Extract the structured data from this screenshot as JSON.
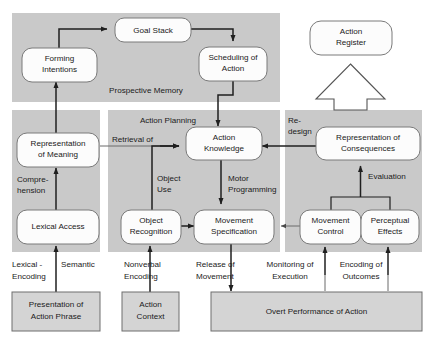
{
  "diagram": {
    "colors": {
      "band_fill": "#c9c9c9",
      "plain_box_fill": "#d4d4d4",
      "node_fill": "#fcfcfc",
      "node_stroke": "#7a7a7a",
      "connector": "#1f1f1f",
      "background": "#ffffff"
    },
    "bands": [
      {
        "id": "prospective-memory",
        "label": "Prospective Memory"
      },
      {
        "id": "lexical-semantic",
        "label": ""
      },
      {
        "id": "action-planning",
        "label": "Action Planning"
      },
      {
        "id": "evaluation-panel",
        "label": ""
      }
    ],
    "nodes": [
      {
        "id": "goal-stack",
        "label_line1": "Goal Stack",
        "label_line2": ""
      },
      {
        "id": "forming-intentions",
        "label_line1": "Forming",
        "label_line2": "Intentions"
      },
      {
        "id": "scheduling-of-action",
        "label_line1": "Scheduling of",
        "label_line2": "Action"
      },
      {
        "id": "action-register",
        "label_line1": "Action",
        "label_line2": "Register"
      },
      {
        "id": "representation-of-meaning",
        "label_line1": "Representation",
        "label_line2": "of Meaning"
      },
      {
        "id": "lexical-access",
        "label_line1": "Lexical Access",
        "label_line2": ""
      },
      {
        "id": "action-knowledge",
        "label_line1": "Action",
        "label_line2": "Knowledge"
      },
      {
        "id": "object-recognition",
        "label_line1": "Object",
        "label_line2": "Recognition"
      },
      {
        "id": "movement-specification",
        "label_line1": "Movement",
        "label_line2": "Specification"
      },
      {
        "id": "representation-of-consequences",
        "label_line1": "Representation of",
        "label_line2": "Consequences"
      },
      {
        "id": "movement-control",
        "label_line1": "Movement",
        "label_line2": "Control"
      },
      {
        "id": "perceptual-effects",
        "label_line1": "Perceptual",
        "label_line2": "Effects"
      },
      {
        "id": "presentation-of-action-phrase",
        "label_line1": "Presentation of",
        "label_line2": "Action Phrase"
      },
      {
        "id": "action-context",
        "label_line1": "Action",
        "label_line2": "Context"
      },
      {
        "id": "overt-performance-of-action",
        "label_line1": "Overt Performance of Action",
        "label_line2": ""
      }
    ],
    "edge_labels": [
      {
        "id": "comprehension",
        "line1": "Compre-",
        "line2": "hension"
      },
      {
        "id": "retrieval-of",
        "line1": "Retrieval  of",
        "line2": ""
      },
      {
        "id": "object-use",
        "line1": "Object",
        "line2": "Use"
      },
      {
        "id": "motor-programming",
        "line1": "Motor",
        "line2": "Programming"
      },
      {
        "id": "re-design",
        "line1": "Re-",
        "line2": "design"
      },
      {
        "id": "evaluation",
        "line1": "Evaluation",
        "line2": ""
      },
      {
        "id": "lexical-encoding",
        "line1": "Lexical -",
        "line2": "Encoding"
      },
      {
        "id": "semantic",
        "line1": "Semantic",
        "line2": ""
      },
      {
        "id": "nonverbal-encoding",
        "line1": "Nonverbal",
        "line2": "Encoding"
      },
      {
        "id": "release-of-movement",
        "line1": "Release of",
        "line2": "Movement"
      },
      {
        "id": "monitoring-of-execution",
        "line1": "Monitoring of",
        "line2": "Execution"
      },
      {
        "id": "encoding-of-outcomes",
        "line1": "Encoding of",
        "line2": "Outcomes"
      }
    ]
  }
}
